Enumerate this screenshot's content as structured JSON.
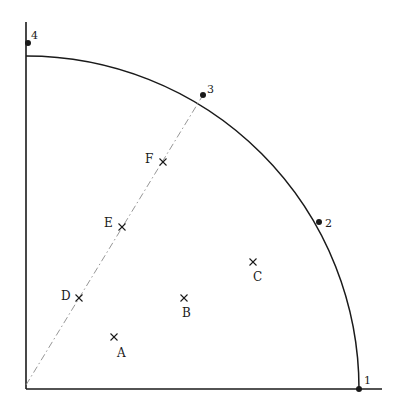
{
  "diagram": {
    "type": "quarter-circle sample layout",
    "colors": {
      "ink": "#1a1a1a",
      "dashed_line": "#8a8a8a",
      "background": "#ffffff"
    },
    "axes": {
      "origin": [
        26,
        389
      ],
      "x_axis_end": [
        382,
        389
      ],
      "y_axis_end": [
        26,
        22
      ]
    },
    "arc": {
      "center": [
        26,
        389
      ],
      "radius": 333,
      "start_deg": 0,
      "end_deg": 90
    },
    "arc_points": [
      {
        "label": "1",
        "x": 359,
        "y": 389,
        "label_x": 364,
        "label_y": 384
      },
      {
        "label": "2",
        "x": 319,
        "y": 222,
        "label_x": 325,
        "label_y": 227
      },
      {
        "label": "3",
        "x": 203,
        "y": 95,
        "label_x": 207,
        "label_y": 93
      },
      {
        "label": "4",
        "x": 28,
        "y": 43,
        "label_x": 31,
        "label_y": 39
      }
    ],
    "dashed_line": {
      "from": [
        26,
        385
      ],
      "to": [
        203,
        95
      ]
    },
    "sample_points": [
      {
        "label": "A",
        "x": 114,
        "y": 337,
        "label_x": 117,
        "label_y": 357
      },
      {
        "label": "B",
        "x": 184,
        "y": 298,
        "label_x": 182,
        "label_y": 317
      },
      {
        "label": "C",
        "x": 253,
        "y": 262,
        "label_x": 253,
        "label_y": 281
      },
      {
        "label": "D",
        "x": 79,
        "y": 298,
        "label_x": 61,
        "label_y": 300
      },
      {
        "label": "E",
        "x": 122,
        "y": 227,
        "label_x": 104,
        "label_y": 227
      },
      {
        "label": "F",
        "x": 163,
        "y": 162,
        "label_x": 145,
        "label_y": 163
      }
    ]
  }
}
